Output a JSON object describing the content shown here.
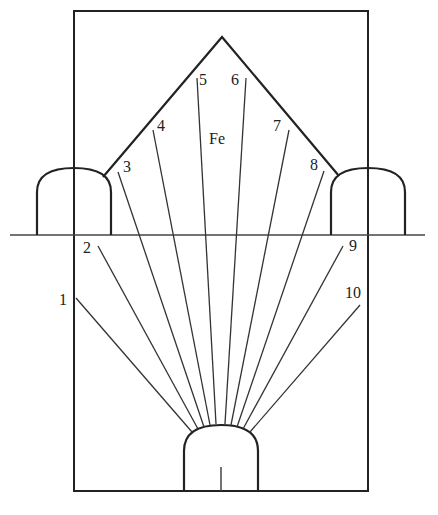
{
  "diagram": {
    "type": "mining blasthole fan layout",
    "ore_label": "Fe",
    "hole_labels": [
      "1",
      "2",
      "3",
      "4",
      "5",
      "6",
      "7",
      "8",
      "9",
      "10"
    ],
    "colors": {
      "line": "#222222",
      "background": "#ffffff"
    }
  }
}
